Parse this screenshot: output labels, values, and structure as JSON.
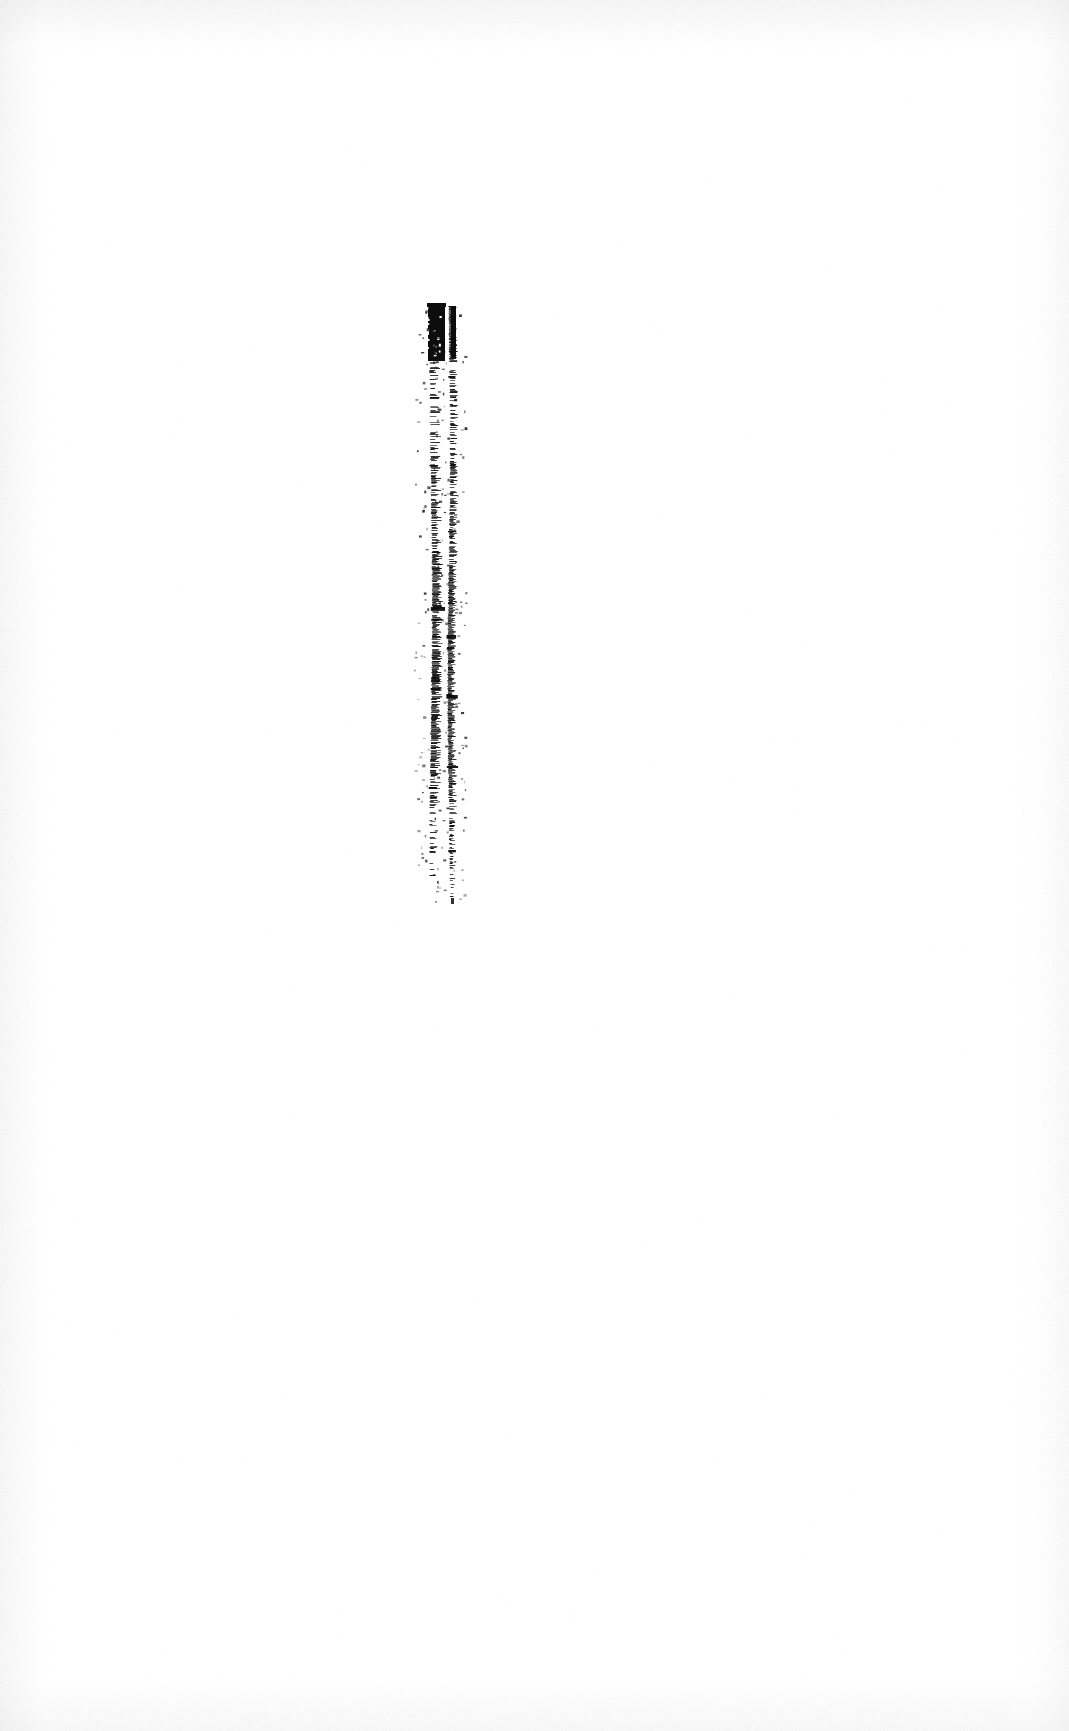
{
  "document": {
    "kind": "scanned-page",
    "page_content": "blank",
    "visible_text": "",
    "page_label": "",
    "background_color": "#ffffff",
    "ink_color": "#0a0a0a",
    "width_px": 1069,
    "height_px": 1731
  },
  "artifact": {
    "name": "vertical-scan-streak",
    "description": "Dense black vertical mark: solid block at top tapering into two broken parallel streaks",
    "color": "#0d0d0d",
    "top_px": 305,
    "bottom_px": 902,
    "left_px": 424,
    "right_px": 458,
    "segments": [
      {
        "id": "solid-block",
        "x": 428,
        "y": 305,
        "w": 17,
        "h": 56,
        "opacity": 1.0
      },
      {
        "id": "block-cap",
        "x": 427,
        "y": 303,
        "w": 19,
        "h": 4,
        "opacity": 1.0
      },
      {
        "id": "right-hairline",
        "x": 451,
        "y": 306,
        "w": 5,
        "h": 52,
        "opacity": 1.0
      }
    ],
    "streaks": [
      {
        "id": "left-streak",
        "x": 431,
        "width": 9,
        "top": 305,
        "bottom": 880
      },
      {
        "id": "right-streak",
        "x": 449,
        "width": 7,
        "top": 306,
        "bottom": 902
      }
    ]
  },
  "paper": {
    "texture": "faint-gray-vignette",
    "edge_tint": "#969696"
  }
}
